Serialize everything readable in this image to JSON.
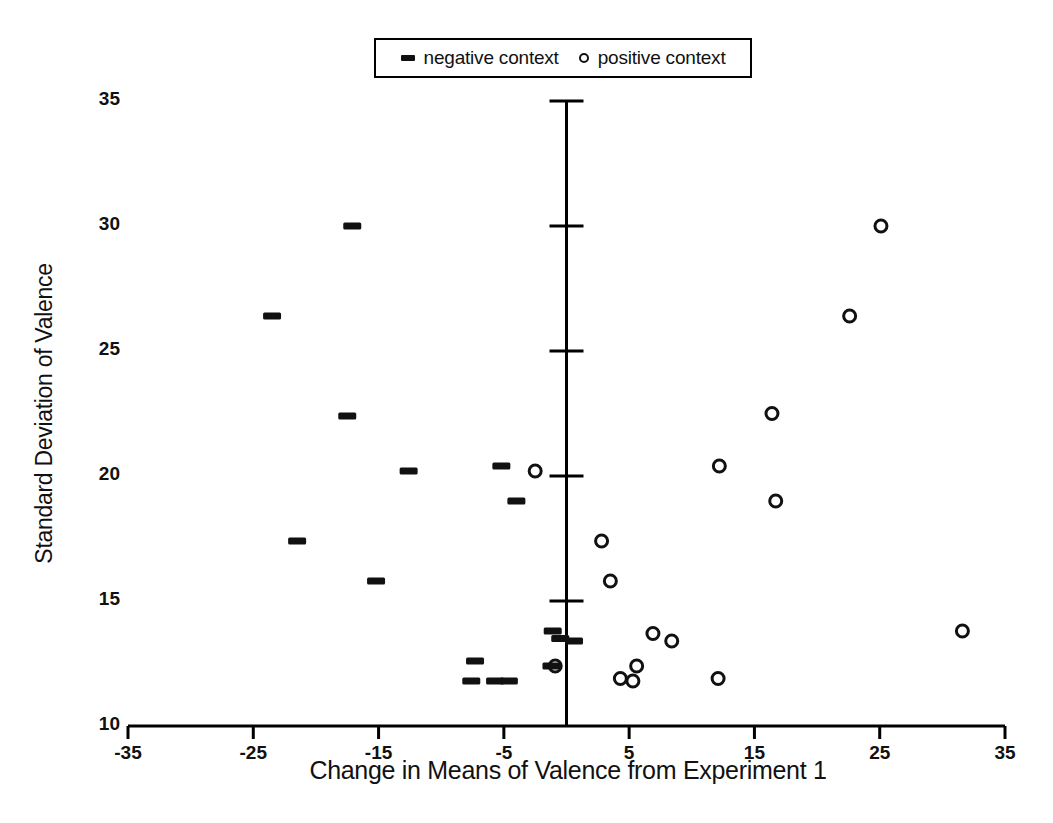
{
  "chart_data": {
    "type": "scatter",
    "title": "",
    "xlabel": "Change in Means of Valence from Experiment 1",
    "ylabel": "Standard Deviation of Valence",
    "xlim": [
      -35,
      35
    ],
    "ylim": [
      10,
      35
    ],
    "xticks": [
      -35,
      -25,
      -15,
      -5,
      5,
      15,
      25,
      35
    ],
    "yticks": [
      10,
      15,
      20,
      25,
      30,
      35
    ],
    "grid": false,
    "legend_position": "top-center",
    "axis_style": "x-axis at bottom, vertical axis drawn at x = 0",
    "series": [
      {
        "name": "negative context",
        "marker": "dash",
        "points": [
          [
            -23.5,
            26.4
          ],
          [
            -17.1,
            30.0
          ],
          [
            -17.5,
            22.4
          ],
          [
            -15.2,
            15.8
          ],
          [
            -21.5,
            17.4
          ],
          [
            -12.6,
            20.2
          ],
          [
            -5.2,
            20.4
          ],
          [
            -4.0,
            19.0
          ],
          [
            -7.3,
            12.6
          ],
          [
            -7.6,
            11.8
          ],
          [
            -5.7,
            11.8
          ],
          [
            -4.6,
            11.8
          ],
          [
            -1.1,
            13.8
          ],
          [
            -0.5,
            13.5
          ],
          [
            0.6,
            13.4
          ],
          [
            -1.2,
            12.4
          ]
        ]
      },
      {
        "name": "positive context",
        "marker": "circle",
        "points": [
          [
            25.1,
            30.0
          ],
          [
            22.6,
            26.4
          ],
          [
            16.4,
            22.5
          ],
          [
            12.2,
            20.4
          ],
          [
            16.7,
            19.0
          ],
          [
            -2.5,
            20.2
          ],
          [
            2.8,
            17.4
          ],
          [
            3.5,
            15.8
          ],
          [
            6.9,
            13.7
          ],
          [
            8.4,
            13.4
          ],
          [
            31.6,
            13.8
          ],
          [
            5.6,
            12.4
          ],
          [
            4.3,
            11.9
          ],
          [
            5.3,
            11.8
          ],
          [
            12.1,
            11.9
          ],
          [
            -0.9,
            12.4
          ]
        ]
      }
    ]
  },
  "legend": {
    "entries": [
      {
        "label": "negative context",
        "marker": "dash"
      },
      {
        "label": "positive context",
        "marker": "circle"
      }
    ]
  },
  "axes": {
    "x_title": "Change in Means of Valence from Experiment 1",
    "y_title": "Standard Deviation of Valence",
    "x_tick_labels": [
      "-35",
      "-25",
      "-15",
      "-5",
      "5",
      "15",
      "25",
      "35"
    ],
    "y_tick_labels": [
      "10",
      "15",
      "20",
      "25",
      "30",
      "35"
    ]
  },
  "colors": {
    "marker": "#111111",
    "axis": "#000000",
    "background": "#ffffff"
  }
}
